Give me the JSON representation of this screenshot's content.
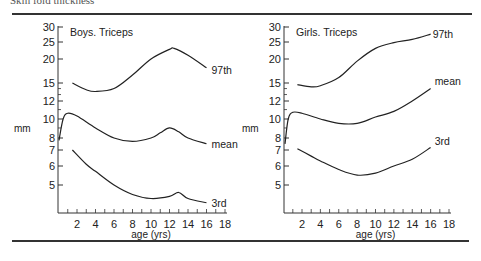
{
  "caption": "Skin fold thickness",
  "chart_data": [
    {
      "type": "line",
      "title": "Boys. Triceps",
      "xlabel": "age (yrs)",
      "ylabel": "mm",
      "x_ticks": [
        "2",
        "4",
        "6",
        "8",
        "10",
        "12",
        "14",
        "16",
        "18"
      ],
      "y_ticks": [
        "30",
        "25",
        "20",
        "15",
        "12",
        "10",
        "8",
        "7",
        "6",
        "5"
      ],
      "y_scale": "log",
      "xlim": [
        0,
        18
      ],
      "series": [
        {
          "name": "97th",
          "x": [
            1.5,
            3,
            4,
            6,
            8,
            10,
            12,
            12.5,
            14,
            16
          ],
          "values": [
            15,
            13.8,
            13.5,
            14,
            16.5,
            20,
            22.7,
            23,
            21,
            18
          ]
        },
        {
          "name": "mean",
          "x": [
            0,
            0.5,
            1,
            2,
            4,
            6,
            8,
            10,
            11,
            12,
            13,
            14,
            16
          ],
          "values": [
            7.8,
            10,
            10.6,
            10.3,
            9,
            8,
            7.7,
            8,
            8.5,
            9,
            8.6,
            8,
            7.5
          ]
        },
        {
          "name": "3rd",
          "x": [
            1.5,
            3,
            4,
            6,
            8,
            10,
            12,
            13,
            14,
            16
          ],
          "values": [
            7,
            6.1,
            5.7,
            5,
            4.5,
            4.3,
            4.4,
            4.6,
            4.3,
            4.1
          ]
        }
      ]
    },
    {
      "type": "line",
      "title": "Girls. Triceps",
      "xlabel": "age (yrs)",
      "ylabel": "mm",
      "x_ticks": [
        "2",
        "4",
        "6",
        "8",
        "10",
        "12",
        "14",
        "16",
        "18"
      ],
      "y_ticks": [
        "30",
        "25",
        "20",
        "15",
        "12",
        "10",
        "8",
        "7",
        "6",
        "5"
      ],
      "y_scale": "log",
      "xlim": [
        0,
        18
      ],
      "series": [
        {
          "name": "97th",
          "x": [
            1.5,
            3,
            4,
            6,
            8,
            10,
            12,
            14,
            16
          ],
          "values": [
            14.7,
            14.3,
            14.5,
            16,
            19.5,
            23,
            24.8,
            25.8,
            27.5
          ]
        },
        {
          "name": "mean",
          "x": [
            0,
            0.5,
            1,
            2,
            4,
            6,
            8,
            10,
            12,
            14,
            16
          ],
          "values": [
            7.5,
            10,
            10.7,
            10.6,
            10,
            9.5,
            9.5,
            10.2,
            10.8,
            12,
            14
          ]
        },
        {
          "name": "3rd",
          "x": [
            1.5,
            3,
            4,
            6,
            8,
            10,
            12,
            14,
            16
          ],
          "values": [
            7.1,
            6.6,
            6.3,
            5.8,
            5.5,
            5.6,
            6,
            6.4,
            7.2
          ]
        }
      ]
    }
  ]
}
